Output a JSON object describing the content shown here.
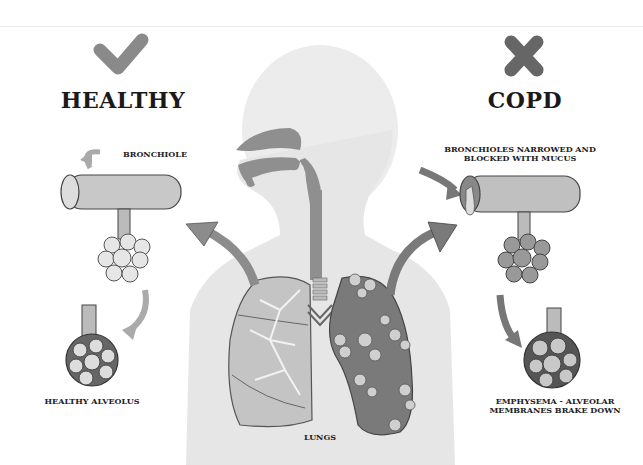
{
  "healthy": {
    "title": "HEALTHY",
    "icon": "check-icon",
    "bronchiole_label": "BRONCHIOLE",
    "alveolus_label": "HEALTHY ALVEOLUS"
  },
  "copd": {
    "title": "COPD",
    "icon": "x-icon",
    "bronchiole_label_line1": "BRONCHIOLES NARROWED AND",
    "bronchiole_label_line2": "BLOCKED WITH MUCUS",
    "alveolus_label_line1": "EMPHYSEMA - ALVEOLAR",
    "alveolus_label_line2": "MEMBRANES BRAKE DOWN"
  },
  "center": {
    "lungs_label": "LUNGS"
  },
  "colors": {
    "icon_gray": "#8a8a8a",
    "icon_dark": "#666666",
    "body_silhouette": "#e6e6e6",
    "airway": "#8f8f8f",
    "healthy_lung": "#c4c4c4",
    "copd_lung": "#7a7a7a",
    "arrow": "#8c8c8c"
  }
}
